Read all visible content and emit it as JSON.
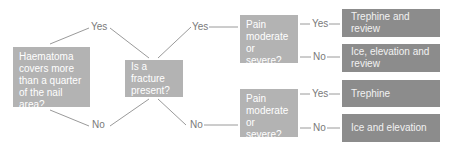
{
  "diagram": {
    "type": "flowchart",
    "colors": {
      "question_box": "#b3b3b3",
      "outcome_box": "#8c8c8c",
      "connector": "#9a9a9a",
      "label_text": "#7a7a7a"
    },
    "nodes": {
      "haematoma": "Haematoma covers more than a quarter of the nail area?",
      "fracture": "Is a fracture present?",
      "pain_top": "Pain moderate or severe?",
      "pain_bottom": "Pain moderate or severe?",
      "outcome_1": "Trephine and review",
      "outcome_2": "Ice, elevation and review",
      "outcome_3": "Trephine",
      "outcome_4": "Ice and elevation"
    },
    "labels": {
      "haem_yes": "Yes",
      "haem_no": "No",
      "frac_yes": "Yes",
      "frac_no": "No",
      "pain_top_yes": "Yes",
      "pain_top_no": "No",
      "pain_bottom_yes": "Yes",
      "pain_bottom_no": "No"
    }
  }
}
